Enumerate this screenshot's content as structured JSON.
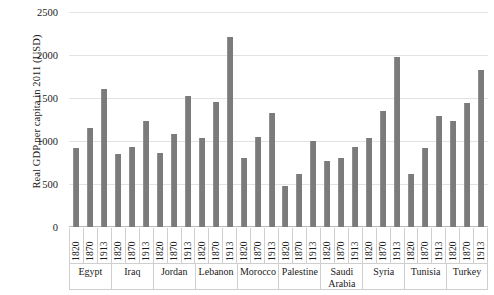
{
  "chart_data": {
    "type": "bar",
    "title": "",
    "xlabel": "",
    "ylabel": "Real GDP per capita in 2011 (USD)",
    "ylim": [
      0,
      2500
    ],
    "ytick_step": 500,
    "yticks": [
      "2500",
      "2000",
      "1500",
      "1000",
      "500",
      "0"
    ],
    "grid": true,
    "legend": false,
    "bar_color": "#7b7b7b",
    "group_label": "country",
    "series_label": "year",
    "categories": [
      "1820",
      "1870",
      "1913"
    ],
    "groups": [
      {
        "name": "Egypt",
        "values": [
          920,
          1150,
          1610
        ]
      },
      {
        "name": "Iraq",
        "values": [
          850,
          930,
          1230
        ]
      },
      {
        "name": "Jordan",
        "values": [
          855,
          1080,
          1525
        ]
      },
      {
        "name": "Lebanon",
        "values": [
          1030,
          1450,
          2205
        ]
      },
      {
        "name": "Morocco",
        "values": [
          805,
          1050,
          1330
        ]
      },
      {
        "name": "Palestine",
        "values": [
          480,
          620,
          1000
        ]
      },
      {
        "name": "Saudi Arabia",
        "values": [
          770,
          800,
          930
        ]
      },
      {
        "name": "Syria",
        "values": [
          1040,
          1345,
          1975
        ]
      },
      {
        "name": "Tunisia",
        "values": [
          620,
          915,
          1290
        ]
      },
      {
        "name": "Turkey",
        "values": [
          1230,
          1440,
          1825
        ]
      }
    ],
    "flat_labels": [
      "1820",
      "1870",
      "1913",
      "1820",
      "1870",
      "1913",
      "1820",
      "1870",
      "1913",
      "1820",
      "1870",
      "1913",
      "1820",
      "1870",
      "1913",
      "1820",
      "1870",
      "1913",
      "1820",
      "1870",
      "1913",
      "1820",
      "1870",
      "1913",
      "1820",
      "1870",
      "1913",
      "1820",
      "1870",
      "1913"
    ]
  }
}
